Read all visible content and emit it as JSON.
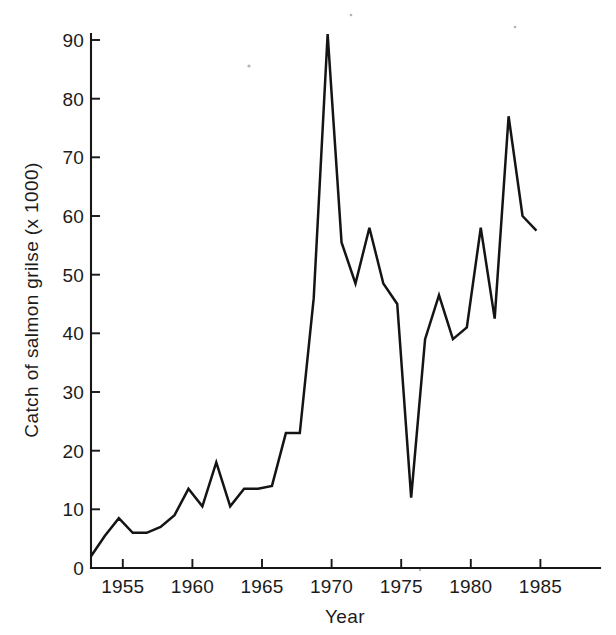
{
  "figure": {
    "background_color": "#ffffff",
    "line_color": "#141414",
    "axis_color": "#171717",
    "text_color": "#1c1c1c"
  },
  "axes": {
    "y_title": "Catch of salmon grilse (x 1000)",
    "x_title": "Year",
    "y_ticks": [
      "0",
      "10",
      "20",
      "30",
      "40",
      "50",
      "60",
      "70",
      "80",
      "90"
    ],
    "x_ticks": [
      "1955",
      "1960",
      "1965",
      "1970",
      "1975",
      "1980",
      "1985"
    ]
  },
  "chart_data": {
    "type": "line",
    "title": "",
    "xlabel": "Year",
    "ylabel": "Catch of salmon grilse (x 1000)",
    "xlim": [
      1953,
      1986
    ],
    "ylim": [
      0,
      93
    ],
    "xticks": [
      1955,
      1960,
      1965,
      1970,
      1975,
      1980,
      1985
    ],
    "yticks": [
      0,
      10,
      20,
      30,
      40,
      50,
      60,
      70,
      80,
      90
    ],
    "grid": false,
    "legend": "none",
    "x": [
      1953,
      1954,
      1955,
      1956,
      1957,
      1958,
      1959,
      1960,
      1961,
      1962,
      1963,
      1964,
      1965,
      1966,
      1967,
      1968,
      1969,
      1970,
      1971,
      1972,
      1973,
      1974,
      1975,
      1976,
      1977,
      1978,
      1979,
      1980,
      1981,
      1982,
      1983,
      1984,
      1985
    ],
    "values": [
      2,
      5.5,
      8.5,
      6,
      6,
      7,
      9,
      13.5,
      10.5,
      18,
      10.5,
      13.5,
      13.5,
      14,
      23,
      23,
      46,
      91,
      55.5,
      48.5,
      58,
      48.5,
      45,
      12,
      39,
      46.5,
      39,
      41,
      58,
      42.5,
      77,
      60,
      57.5
    ],
    "series": [
      {
        "name": "Catch of salmon grilse",
        "values": [
          2,
          5.5,
          8.5,
          6,
          6,
          7,
          9,
          13.5,
          10.5,
          18,
          10.5,
          13.5,
          13.5,
          14,
          23,
          23,
          46,
          91,
          55.5,
          48.5,
          58,
          48.5,
          45,
          12,
          39,
          46.5,
          39,
          41,
          58,
          42.5,
          77,
          60,
          57.5
        ]
      }
    ]
  }
}
